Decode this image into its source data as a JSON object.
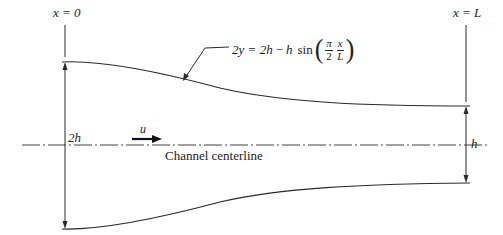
{
  "diagram": {
    "type": "converging channel schematic",
    "labels": {
      "inlet_station": "x = 0",
      "outlet_station": "x = L",
      "inlet_height": "2h",
      "outlet_height": "h",
      "velocity": "u",
      "centerline": "Channel centerline"
    },
    "equation": {
      "lhs": "2y",
      "eq": "=",
      "term1": "2h",
      "minus": "−",
      "term2": "h",
      "func": "sin",
      "frac1_num": "π",
      "frac1_den": "2",
      "frac2_num": "x",
      "frac2_den": "L",
      "paren_open": "(",
      "paren_close": ")"
    },
    "colors": {
      "line": "#2a2a2a",
      "background": "#ffffff"
    }
  }
}
